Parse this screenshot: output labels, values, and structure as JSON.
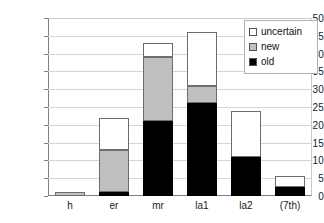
{
  "chart_data": {
    "type": "bar",
    "stacked": true,
    "title": "",
    "xlabel": "",
    "ylabel": "",
    "categories": [
      "h",
      "er",
      "mr",
      "la1",
      "la2",
      "(7th)"
    ],
    "series": [
      {
        "name": "old",
        "color": "#000000",
        "values": [
          0,
          1,
          21,
          26,
          11,
          2.5
        ]
      },
      {
        "name": "new",
        "color": "#c0c0c0",
        "values": [
          1,
          12,
          18,
          5,
          0,
          0
        ]
      },
      {
        "name": "uncertain",
        "color": "#ffffff",
        "values": [
          0,
          9,
          4,
          15,
          13,
          3
        ]
      }
    ],
    "totals": [
      1,
      22,
      43,
      46,
      24,
      5.5
    ],
    "ylim": [
      0,
      50
    ],
    "ytick_step": 5,
    "yticks": [
      "50",
      "45",
      "40",
      "35",
      "30",
      "25",
      "20",
      "15",
      "10",
      "5",
      "0"
    ],
    "grid": true,
    "legend_position": "top-right",
    "legend_entries": [
      "uncertain",
      "new",
      "old"
    ]
  },
  "legend": {
    "items": [
      {
        "label": "uncertain",
        "swatch": "#ffffff"
      },
      {
        "label": "new",
        "swatch": "#c0c0c0"
      },
      {
        "label": "old",
        "swatch": "#000000"
      }
    ]
  }
}
